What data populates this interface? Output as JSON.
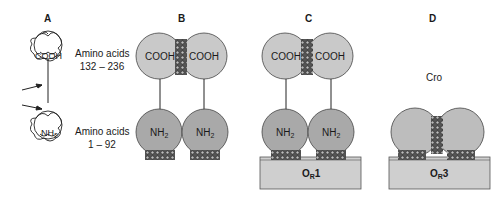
{
  "figure": {
    "panels": [
      {
        "id": "A",
        "label": "A",
        "upper_domain": {
          "label": "COOH",
          "caption_line1": "Amino acids",
          "caption_line2": "132 – 236"
        },
        "lower_domain": {
          "label": "NH",
          "subscript": "2",
          "caption_line1": "Amino acids",
          "caption_line2": "1 – 92"
        },
        "arrows": 2
      },
      {
        "id": "B",
        "label": "B",
        "upper_domains": [
          "COOH",
          "COOH"
        ],
        "lower_domains": [
          {
            "label": "NH",
            "subscript": "2"
          },
          {
            "label": "NH",
            "subscript": "2"
          }
        ]
      },
      {
        "id": "C",
        "label": "C",
        "upper_domains": [
          "COOH",
          "COOH"
        ],
        "lower_domains": [
          {
            "label": "NH",
            "subscript": "2"
          },
          {
            "label": "NH",
            "subscript": "2"
          }
        ],
        "operator": {
          "label": "O",
          "subscript": "R",
          "suffix": "1"
        }
      },
      {
        "id": "D",
        "label": "D",
        "protein_label": "Cro",
        "operator": {
          "label": "O",
          "subscript": "R",
          "suffix": "3"
        }
      }
    ]
  },
  "colors": {
    "domain_light": "#c9c9c9",
    "domain_dark": "#a9a9a9",
    "operator_box": "#cfcfcf",
    "outline": "#3a3a3a",
    "hatch": "#2a2a2a"
  }
}
